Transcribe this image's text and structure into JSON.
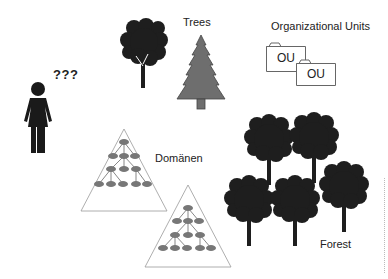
{
  "diagram": {
    "person": {
      "label": "???",
      "icon": "woman-icon"
    },
    "trees": {
      "label": "Trees",
      "icons": [
        "deciduous-tree-icon",
        "conifer-tree-icon"
      ]
    },
    "organizational_units": {
      "label": "Organizational Units",
      "folders": [
        {
          "label": "OU"
        },
        {
          "label": "OU"
        }
      ]
    },
    "domains": {
      "label": "Domänen",
      "icons": [
        "domain-hierarchy-triangle",
        "domain-hierarchy-triangle"
      ]
    },
    "forest": {
      "label": "Forest",
      "tree_count": 5
    }
  },
  "colors": {
    "tree_dark": "#1e1e1e",
    "conifer_fill": "#6e6e6e",
    "node_fill": "#777777",
    "line": "#555555",
    "text": "#222222"
  }
}
